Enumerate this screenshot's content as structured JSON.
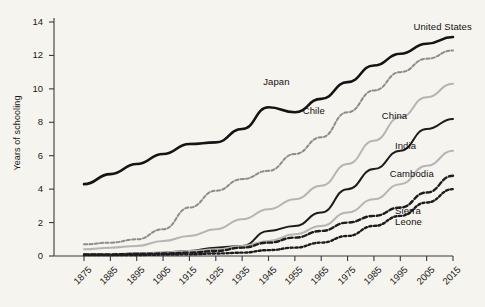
{
  "chart_data": {
    "type": "line",
    "title": "",
    "xlabel": "",
    "ylabel": "Years of schooling",
    "xlim": [
      1875,
      2015
    ],
    "ylim": [
      0,
      14
    ],
    "grid": false,
    "legend_position": "inline-right",
    "x": [
      1875,
      1885,
      1895,
      1905,
      1915,
      1925,
      1935,
      1945,
      1955,
      1965,
      1975,
      1985,
      1995,
      2005,
      2015
    ],
    "xticks": [
      "1875",
      "1885",
      "1895",
      "1905",
      "1915",
      "1925",
      "1935",
      "1945",
      "1955",
      "1965",
      "1975",
      "1985",
      "1995",
      "2005",
      "2015"
    ],
    "yticks": [
      "0",
      "2",
      "4",
      "6",
      "8",
      "10",
      "12",
      "14"
    ],
    "ytick_values": [
      0,
      2,
      4,
      6,
      8,
      10,
      12,
      14
    ],
    "series": [
      {
        "name": "United States",
        "style": "solid",
        "color": "#141414",
        "width": 2.6,
        "values": [
          4.3,
          4.9,
          5.5,
          6.1,
          6.7,
          6.8,
          7.6,
          8.9,
          8.6,
          9.4,
          10.4,
          11.4,
          12.1,
          12.7,
          13.1
        ],
        "label_x": 2000,
        "label_y": 13.7
      },
      {
        "name": "Japan",
        "style": "dashed",
        "color": "#8c8c8c",
        "width": 2.0,
        "values": [
          0.7,
          0.8,
          1.0,
          1.6,
          2.9,
          3.9,
          4.6,
          5.1,
          6.1,
          7.1,
          8.6,
          9.9,
          11.0,
          11.8,
          12.3
        ],
        "label_x": 1943,
        "label_y": 10.4
      },
      {
        "name": "Chile",
        "style": "solid",
        "color": "#b5b5b5",
        "width": 2.0,
        "values": [
          0.4,
          0.5,
          0.6,
          0.9,
          1.2,
          1.6,
          2.2,
          2.8,
          3.4,
          4.2,
          5.5,
          6.9,
          8.3,
          9.5,
          10.3
        ],
        "label_x": 1958,
        "label_y": 8.7
      },
      {
        "name": "China",
        "style": "solid",
        "color": "#1c1c1c",
        "width": 2.0,
        "values": [
          0.1,
          0.1,
          0.15,
          0.2,
          0.3,
          0.5,
          0.6,
          1.5,
          1.8,
          2.6,
          4.0,
          5.2,
          6.3,
          7.6,
          8.2
        ],
        "label_x": 1988,
        "label_y": 8.4
      },
      {
        "name": "India",
        "style": "solid",
        "color": "#b5b5b5",
        "width": 2.0,
        "values": [
          0.1,
          0.12,
          0.15,
          0.2,
          0.3,
          0.4,
          0.6,
          0.9,
          1.3,
          1.8,
          2.6,
          3.4,
          4.3,
          5.4,
          6.3
        ],
        "label_x": 1993,
        "label_y": 6.6
      },
      {
        "name": "Cambodia",
        "style": "dashed-thick",
        "color": "#1c1c1c",
        "width": 2.4,
        "values": [
          0.1,
          0.1,
          0.12,
          0.15,
          0.2,
          0.3,
          0.5,
          0.8,
          1.1,
          1.5,
          2.0,
          2.4,
          2.9,
          3.8,
          4.8
        ],
        "label_x": 1991,
        "label_y": 4.9
      },
      {
        "name": "Sierra\nLeone",
        "style": "dotted",
        "color": "#1c1c1c",
        "width": 2.4,
        "values": [
          0.05,
          0.05,
          0.06,
          0.08,
          0.1,
          0.15,
          0.2,
          0.35,
          0.5,
          0.8,
          1.2,
          1.8,
          2.4,
          3.2,
          4.0
        ],
        "label_x": 1993,
        "label_y": 2.7
      }
    ]
  }
}
